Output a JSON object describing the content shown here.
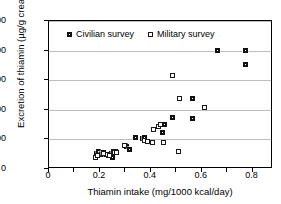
{
  "chart_data": {
    "type": "scatter",
    "title": "",
    "xlabel": "Thiamin intake (mg/1000 kcal/day)",
    "ylabel": "Excretion of thiamin (µg/g creatinine)",
    "xlim": [
      0,
      0.88
    ],
    "ylim": [
      0,
      500
    ],
    "xticks": [
      "0",
      "0.2",
      "0.4",
      "0.6",
      "0.8"
    ],
    "xtick_values": [
      0,
      0.2,
      0.4,
      0.6,
      0.8
    ],
    "yticks": [
      "0",
      "100",
      "200",
      "300",
      "400",
      "500"
    ],
    "ytick_values": [
      0,
      100,
      200,
      300,
      400,
      500
    ],
    "grid": "horizontal",
    "legend_position": "top-left-inside",
    "series": [
      {
        "name": "Civilian survey",
        "marker": "filled-square",
        "color": "#111111",
        "points": [
          [
            0.185,
            52
          ],
          [
            0.195,
            60
          ],
          [
            0.205,
            48
          ],
          [
            0.215,
            55
          ],
          [
            0.225,
            50
          ],
          [
            0.235,
            45
          ],
          [
            0.245,
            52
          ],
          [
            0.248,
            40
          ],
          [
            0.255,
            60
          ],
          [
            0.262,
            58
          ],
          [
            0.3,
            80
          ],
          [
            0.305,
            75
          ],
          [
            0.315,
            67
          ],
          [
            0.34,
            105
          ],
          [
            0.368,
            104
          ],
          [
            0.375,
            108
          ],
          [
            0.445,
            122
          ],
          [
            0.455,
            152
          ],
          [
            0.485,
            174
          ],
          [
            0.562,
            170
          ],
          [
            0.565,
            238
          ],
          [
            0.66,
            402
          ],
          [
            0.77,
            400
          ],
          [
            0.772,
            352
          ]
        ]
      },
      {
        "name": "Military survey",
        "marker": "open-square",
        "color": "#1a1a1a",
        "points": [
          [
            0.182,
            38
          ],
          [
            0.19,
            46
          ],
          [
            0.215,
            52
          ],
          [
            0.228,
            48
          ],
          [
            0.238,
            44
          ],
          [
            0.252,
            58
          ],
          [
            0.258,
            56
          ],
          [
            0.265,
            55
          ],
          [
            0.295,
            78
          ],
          [
            0.375,
            96
          ],
          [
            0.385,
            92
          ],
          [
            0.405,
            90
          ],
          [
            0.412,
            132
          ],
          [
            0.432,
            144
          ],
          [
            0.438,
            150
          ],
          [
            0.448,
            88
          ],
          [
            0.485,
            316
          ],
          [
            0.508,
            58
          ],
          [
            0.512,
            239
          ],
          [
            0.612,
            208
          ]
        ]
      }
    ]
  },
  "legend": {
    "items": [
      {
        "label": "Civilian survey",
        "marker": "filled-square"
      },
      {
        "label": "Military survey",
        "marker": "open-square"
      }
    ]
  }
}
